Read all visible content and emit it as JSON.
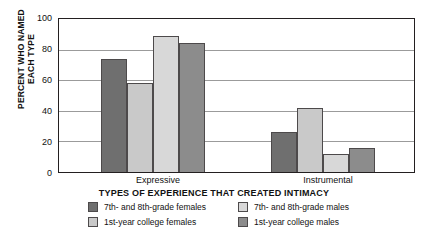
{
  "chart_data": {
    "type": "bar",
    "title": "",
    "xlabel": "TYPES OF EXPERIENCE THAT CREATED INTIMACY",
    "ylabel": "PERCENT WHO NAMED\nEACH TYPE",
    "ylim": [
      0,
      100
    ],
    "yticks": [
      0,
      20,
      40,
      60,
      80,
      100
    ],
    "grid": true,
    "legend_position": "bottom",
    "categories": [
      "Expressive",
      "Instrumental"
    ],
    "series": [
      {
        "name": "7th- and 8th-grade females",
        "color": "#6f6f6f",
        "values": [
          74,
          26
        ]
      },
      {
        "name": "1st-year college females",
        "color": "#c9c9c9",
        "values": [
          58,
          42
        ]
      },
      {
        "name": "7th- and 8th-grade males",
        "color": "#d8d8d8",
        "values": [
          89,
          12
        ]
      },
      {
        "name": "1st-year college males",
        "color": "#8c8c8c",
        "values": [
          84,
          16
        ]
      }
    ]
  },
  "axis": {
    "y_title": "PERCENT WHO NAMED\nEACH TYPE",
    "x_title": "TYPES OF EXPERIENCE THAT CREATED INTIMACY",
    "y_tick_labels": [
      "100",
      "80",
      "60",
      "40",
      "20",
      "0"
    ],
    "category_labels": [
      "Expressive",
      "Instrumental"
    ]
  },
  "legend": {
    "items": [
      {
        "label": "7th- and 8th-grade females",
        "color": "#6f6f6f"
      },
      {
        "label": "7th- and 8th-grade males",
        "color": "#d8d8d8"
      },
      {
        "label": "1st-year college females",
        "color": "#c9c9c9"
      },
      {
        "label": "1st-year college males",
        "color": "#8c8c8c"
      }
    ]
  }
}
